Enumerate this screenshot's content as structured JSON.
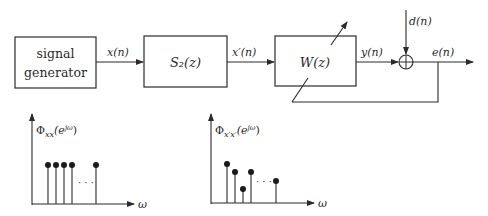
{
  "diagram": {
    "type": "block-diagram",
    "blocks": [
      {
        "id": "signal-generator",
        "label_line1": "signal",
        "label_line2": "generator"
      },
      {
        "id": "secondary-path",
        "label": "S₂(z)"
      },
      {
        "id": "adaptive-filter",
        "label": "W(z)"
      }
    ],
    "signals": {
      "x": "x(n)",
      "x_prime": "x′(n)",
      "y": "y(n)",
      "d": "d(n)",
      "e": "e(n)"
    },
    "summing_junction": {
      "symbol": "⊕"
    },
    "spectra": [
      {
        "id": "input-spectrum",
        "ylabel": "Φxx(e^{jω})",
        "ylabel_main": "Φ",
        "ylabel_sub": "xx",
        "ylabel_arg": "(e",
        "ylabel_sup": "jω",
        "ylabel_close": ")",
        "xlabel": "ω",
        "ellipsis": "· · ·",
        "stems": [
          1,
          1,
          1,
          1,
          1
        ],
        "note": "flat (white) spectrum"
      },
      {
        "id": "filtered-spectrum",
        "ylabel": "Φx′x′(e^{jω})",
        "ylabel_main": "Φ",
        "ylabel_sub": "x′x′",
        "ylabel_arg": "(e",
        "ylabel_sup": "jω",
        "ylabel_close": ")",
        "xlabel": "ω",
        "ellipsis": "· · ·",
        "stems": [
          1.0,
          0.82,
          0.38,
          0.82,
          0.6
        ],
        "note": "colored spectrum after S₂(z)"
      }
    ]
  }
}
